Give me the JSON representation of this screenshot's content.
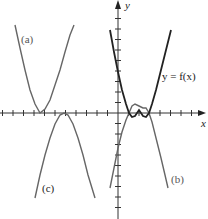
{
  "chart_data": {
    "type": "line",
    "title": "",
    "xlabel": "x",
    "ylabel": "y",
    "grid": false,
    "axis_origin_px": [
      118,
      113
    ],
    "tick_spacing_px": 10.5,
    "series": [
      {
        "name": "y = f(x)",
        "label": "y = f(x)",
        "color": "#222222",
        "description": "W-shaped curve with roots near x=1 and x=3, local max at x=2",
        "points_px": [
          [
            110,
            30
          ],
          [
            114,
            52
          ],
          [
            118,
            72
          ],
          [
            122,
            90
          ],
          [
            126,
            104
          ],
          [
            129,
            113
          ],
          [
            132,
            117
          ],
          [
            135,
            116
          ],
          [
            139,
            110
          ],
          [
            143,
            116
          ],
          [
            146,
            117
          ],
          [
            149,
            113
          ],
          [
            152,
            104
          ],
          [
            156,
            90
          ],
          [
            161,
            70
          ],
          [
            166,
            50
          ],
          [
            171,
            30
          ]
        ]
      },
      {
        "name": "(a)",
        "label": "(a)",
        "color": "#666666",
        "description": "Upward parabola with vertex on x-axis left of origin",
        "points_px": [
          [
            15,
            25
          ],
          [
            20,
            48
          ],
          [
            25,
            70
          ],
          [
            30,
            90
          ],
          [
            35,
            104
          ],
          [
            40,
            113
          ],
          [
            45,
            109
          ],
          [
            50,
            100
          ],
          [
            55,
            85
          ],
          [
            60,
            70
          ],
          [
            65,
            52
          ],
          [
            70,
            35
          ],
          [
            74,
            25
          ]
        ]
      },
      {
        "name": "(b)",
        "label": "(b)",
        "color": "#666666",
        "description": "Negative of f(x): inverted W with roots near x=1 and x=3",
        "points_px": [
          [
            110,
            188
          ],
          [
            114,
            168
          ],
          [
            118,
            148
          ],
          [
            122,
            132
          ],
          [
            126,
            120
          ],
          [
            129,
            113
          ],
          [
            132,
            106
          ],
          [
            135,
            104
          ],
          [
            139,
            106
          ],
          [
            143,
            108
          ],
          [
            146,
            108
          ],
          [
            149,
            113
          ],
          [
            152,
            122
          ],
          [
            156,
            138
          ],
          [
            161,
            158
          ],
          [
            165,
            175
          ],
          [
            168,
            188
          ]
        ]
      },
      {
        "name": "(c)",
        "label": "(c)",
        "color": "#666666",
        "description": "Downward parabola with vertex on x-axis left of origin",
        "points_px": [
          [
            35,
            198
          ],
          [
            40,
            175
          ],
          [
            45,
            155
          ],
          [
            50,
            138
          ],
          [
            55,
            124
          ],
          [
            60,
            115
          ],
          [
            64,
            113
          ],
          [
            68,
            115
          ],
          [
            73,
            124
          ],
          [
            78,
            138
          ],
          [
            83,
            155
          ],
          [
            88,
            175
          ],
          [
            95,
            198
          ]
        ]
      }
    ],
    "annotations": [
      {
        "text": "(a)",
        "pos_px": [
          22,
          42
        ]
      },
      {
        "text": "(b)",
        "pos_px": [
          172,
          182
        ]
      },
      {
        "text": "(c)",
        "pos_px": [
          42,
          192
        ]
      },
      {
        "text": "y = f(x)",
        "pos_px": [
          162,
          80
        ]
      }
    ]
  },
  "labels": {
    "x_axis": "x",
    "y_axis": "y",
    "curve_f": "y = f(x)",
    "curve_a": "(a)",
    "curve_b": "(b)",
    "curve_c": "(c)"
  },
  "colors": {
    "axis": "#333333",
    "f_curve": "#222222",
    "transformed_curves": "#6a6a6a"
  }
}
